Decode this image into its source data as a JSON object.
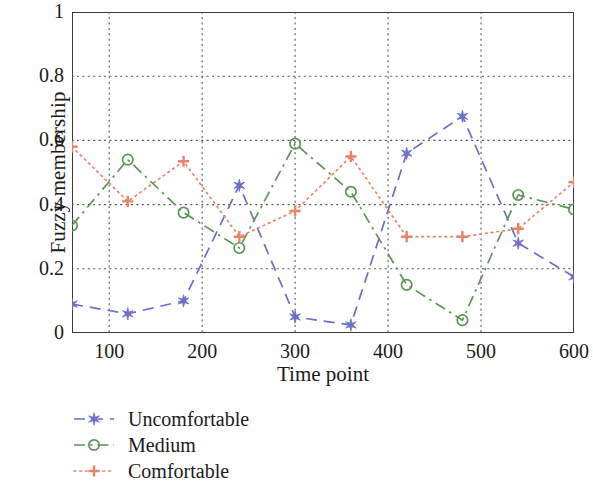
{
  "chart_data": {
    "type": "line",
    "title": "",
    "xlabel": "Time point",
    "ylabel": "Fuzzy membership",
    "x": [
      60,
      120,
      180,
      240,
      300,
      360,
      420,
      480,
      540,
      600
    ],
    "xlim": [
      60,
      600
    ],
    "ylim": [
      0,
      1
    ],
    "xticks": [
      100,
      200,
      300,
      400,
      500,
      600
    ],
    "xtick_labels": [
      "100",
      "200",
      "300",
      "400",
      "500",
      "600"
    ],
    "yticks": [
      0,
      0.2,
      0.4,
      0.6,
      0.8,
      1
    ],
    "ytick_labels": [
      "0",
      "0.2",
      "0.4",
      "0.6",
      "0.8",
      "1"
    ],
    "grid": "dotted",
    "legend_position": "below-left",
    "series": [
      {
        "name": "Uncomfortable",
        "color": "#6d6ec6",
        "marker": "star",
        "linestyle": "dashed",
        "values": [
          0.09,
          0.06,
          0.1,
          0.46,
          0.05,
          0.025,
          0.56,
          0.675,
          0.28,
          0.175
        ]
      },
      {
        "name": "Medium",
        "color": "#5e9457",
        "marker": "circle",
        "linestyle": "dashdot",
        "values": [
          0.335,
          0.54,
          0.375,
          0.265,
          0.59,
          0.44,
          0.15,
          0.04,
          0.43,
          0.385
        ]
      },
      {
        "name": "Comfortable",
        "color": "#e8836b",
        "marker": "plus",
        "linestyle": "dotted",
        "values": [
          0.58,
          0.41,
          0.535,
          0.3,
          0.38,
          0.55,
          0.3,
          0.3,
          0.325,
          0.47
        ]
      }
    ]
  },
  "axes": {
    "xlabel": "Time point",
    "ylabel": "Fuzzy membership"
  },
  "legend": {
    "items": [
      {
        "label": "Uncomfortable"
      },
      {
        "label": "Medium"
      },
      {
        "label": "Comfortable"
      }
    ]
  }
}
